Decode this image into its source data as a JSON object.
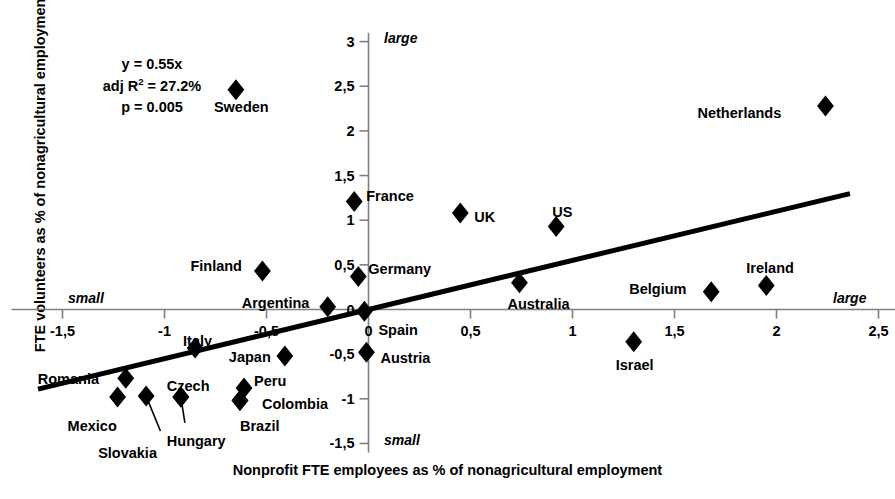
{
  "chart_data": {
    "type": "scatter",
    "title": "",
    "xlabel": "Nonprofit FTE employees as % of nonagricultural employment",
    "ylabel": "FTE volunteers as % of nonagricultural employment",
    "xlim": [
      -1.75,
      2.65
    ],
    "ylim": [
      -1.6,
      3.1
    ],
    "xticks": [
      "-1,5",
      "-1",
      "-0,5",
      "0",
      "0,5",
      "1",
      "1,5",
      "2",
      "2,5"
    ],
    "xtick_values": [
      -1.5,
      -1,
      -0.5,
      0,
      0.5,
      1,
      1.5,
      2,
      2.5
    ],
    "yticks": [
      "3",
      "2,5",
      "2",
      "1,5",
      "1",
      "0,5",
      "0",
      "-0,5",
      "-1",
      "-1,5"
    ],
    "ytick_values": [
      3,
      2.5,
      2,
      1.5,
      1,
      0.5,
      0,
      -0.5,
      -1,
      -1.5
    ],
    "grid": false,
    "legend": "none",
    "decimal_separator": "comma",
    "annotations": {
      "x_axis_left": "small",
      "x_axis_right": "large",
      "y_axis_top": "large",
      "y_axis_bottom": "small",
      "equation": "y = 0.55x",
      "adj_r2_prefix": "adj R",
      "adj_r2_sup": "2",
      "adj_r2_value": " = 27.2%",
      "pvalue": "p = 0.005"
    },
    "fit_line": {
      "slope": 0.55,
      "intercept": 0,
      "x_start": -1.62,
      "x_end": 2.36,
      "color": "#000000",
      "width_px": 5
    },
    "points": [
      {
        "label": "Sweden",
        "x": -0.65,
        "y": 2.46,
        "label_dx": -22,
        "label_dy": 18
      },
      {
        "label": "Netherlands",
        "x": 2.24,
        "y": 2.28,
        "label_dx": -128,
        "label_dy": 8
      },
      {
        "label": "France",
        "x": -0.07,
        "y": 1.21,
        "label_dx": 12,
        "label_dy": -4
      },
      {
        "label": "UK",
        "x": 0.45,
        "y": 1.08,
        "label_dx": 14,
        "label_dy": 5
      },
      {
        "label": "US",
        "x": 0.92,
        "y": 0.93,
        "label_dx": -4,
        "label_dy": -13
      },
      {
        "label": "Germany",
        "x": -0.05,
        "y": 0.37,
        "label_dx": 10,
        "label_dy": -6
      },
      {
        "label": "Finland",
        "x": -0.52,
        "y": 0.43,
        "label_dx": -72,
        "label_dy": -4
      },
      {
        "label": "Argentina",
        "x": -0.2,
        "y": 0.03,
        "label_dx": -86,
        "label_dy": -3
      },
      {
        "label": "Spain",
        "x": -0.02,
        "y": -0.02,
        "label_dx": 14,
        "label_dy": 20
      },
      {
        "label": "Austria",
        "x": -0.01,
        "y": -0.48,
        "label_dx": 14,
        "label_dy": 7
      },
      {
        "label": "Australia",
        "x": 0.74,
        "y": 0.3,
        "label_dx": -12,
        "label_dy": 22
      },
      {
        "label": "Belgium",
        "x": 1.68,
        "y": 0.2,
        "label_dx": -82,
        "label_dy": -2
      },
      {
        "label": "Ireland",
        "x": 1.95,
        "y": 0.27,
        "label_dx": -20,
        "label_dy": -16
      },
      {
        "label": "Israel",
        "x": 1.3,
        "y": -0.36,
        "label_dx": -18,
        "label_dy": 24
      },
      {
        "label": "Japan",
        "x": -0.41,
        "y": -0.52,
        "label_dx": -56,
        "label_dy": 2
      },
      {
        "label": "Italy",
        "x": -0.85,
        "y": -0.43,
        "label_dx": -12,
        "label_dy": -6
      },
      {
        "label": "Romania",
        "x": -1.19,
        "y": -0.77,
        "label_dx": -88,
        "label_dy": 2
      },
      {
        "label": "Mexico",
        "x": -1.23,
        "y": -0.98,
        "label_dx": -50,
        "label_dy": 30
      },
      {
        "label": "Slovakia",
        "x": -1.09,
        "y": -0.97,
        "label_dx": -48,
        "label_dy": 58
      },
      {
        "label": "Czech",
        "x": -0.92,
        "y": -0.98,
        "label_dx": -14,
        "label_dy": -10
      },
      {
        "label": "Hungary",
        "x": -0.92,
        "y": -0.98,
        "label_dx": -14,
        "label_dy": 45
      },
      {
        "label": "Peru",
        "x": -0.61,
        "y": -0.88,
        "label_dx": 10,
        "label_dy": -6
      },
      {
        "label": "Brazil",
        "x": -0.63,
        "y": -1.02,
        "label_dx": 0,
        "label_dy": 26
      },
      {
        "label": "Colombia",
        "x": -0.63,
        "y": -1.02,
        "label_dx": 22,
        "label_dy": 4
      }
    ]
  }
}
